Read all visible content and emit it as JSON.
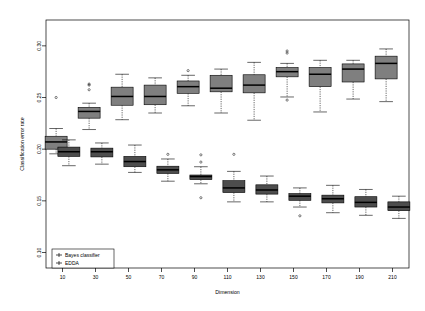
{
  "chart_data": {
    "type": "box",
    "title": "",
    "xlabel": "Dimension",
    "ylabel": "Classification error rate",
    "xtick_labels": [
      "10",
      "30",
      "50",
      "70",
      "90",
      "110",
      "130",
      "150",
      "170",
      "190",
      "210"
    ],
    "ytick_labels": [
      "0.10",
      "0.15",
      "0.20",
      "0.25",
      "0.30"
    ],
    "ytick_values": [
      0.1,
      0.15,
      0.2,
      0.25,
      0.3
    ],
    "ylim": [
      0.085,
      0.325
    ],
    "grid": false,
    "legend_position": "bottom-left",
    "legend": [
      {
        "label": "Bayes classifier",
        "color": "#4d4d4d"
      },
      {
        "label": "EDDA",
        "color": "#7f7f7f"
      }
    ],
    "categories": [
      10,
      30,
      50,
      70,
      90,
      110,
      130,
      150,
      170,
      190,
      210
    ],
    "series": [
      {
        "name": "EDDA",
        "color": "#7f7f7f",
        "boxes": [
          {
            "x": 10,
            "min": 0.1955,
            "q1": 0.2,
            "median": 0.207,
            "q3": 0.2125,
            "max": 0.22,
            "outliers": [
              0.25
            ]
          },
          {
            "x": 30,
            "min": 0.219,
            "q1": 0.23,
            "median": 0.2365,
            "q3": 0.2405,
            "max": 0.2445,
            "outliers": [
              0.2575,
              0.262,
              0.263
            ]
          },
          {
            "x": 50,
            "min": 0.2285,
            "q1": 0.2425,
            "median": 0.251,
            "q3": 0.26,
            "max": 0.2725,
            "outliers": []
          },
          {
            "x": 70,
            "min": 0.235,
            "q1": 0.243,
            "median": 0.251,
            "q3": 0.262,
            "max": 0.269,
            "outliers": []
          },
          {
            "x": 90,
            "min": 0.242,
            "q1": 0.254,
            "median": 0.2605,
            "q3": 0.266,
            "max": 0.2715,
            "outliers": [
              0.276
            ]
          },
          {
            "x": 110,
            "min": 0.235,
            "q1": 0.2555,
            "median": 0.259,
            "q3": 0.2715,
            "max": 0.2775,
            "outliers": []
          },
          {
            "x": 130,
            "min": 0.228,
            "q1": 0.2545,
            "median": 0.262,
            "q3": 0.272,
            "max": 0.284,
            "outliers": []
          },
          {
            "x": 150,
            "min": 0.2505,
            "q1": 0.27,
            "median": 0.275,
            "q3": 0.279,
            "max": 0.283,
            "outliers": [
              0.2475,
              0.293,
              0.295
            ]
          },
          {
            "x": 170,
            "min": 0.236,
            "q1": 0.2605,
            "median": 0.2725,
            "q3": 0.279,
            "max": 0.286,
            "outliers": []
          },
          {
            "x": 190,
            "min": 0.2485,
            "q1": 0.265,
            "median": 0.2775,
            "q3": 0.2825,
            "max": 0.286,
            "outliers": []
          },
          {
            "x": 210,
            "min": 0.246,
            "q1": 0.268,
            "median": 0.283,
            "q3": 0.29,
            "max": 0.297,
            "outliers": []
          }
        ]
      },
      {
        "name": "Bayes classifier",
        "color": "#4d4d4d",
        "boxes": [
          {
            "x": 10,
            "min": 0.184,
            "q1": 0.193,
            "median": 0.1975,
            "q3": 0.202,
            "max": 0.209,
            "outliers": []
          },
          {
            "x": 30,
            "min": 0.1855,
            "q1": 0.1925,
            "median": 0.1975,
            "q3": 0.201,
            "max": 0.206,
            "outliers": []
          },
          {
            "x": 50,
            "min": 0.1775,
            "q1": 0.183,
            "median": 0.188,
            "q3": 0.193,
            "max": 0.204,
            "outliers": []
          },
          {
            "x": 70,
            "min": 0.169,
            "q1": 0.1765,
            "median": 0.18,
            "q3": 0.1835,
            "max": 0.1905,
            "outliers": [
              0.195
            ]
          },
          {
            "x": 90,
            "min": 0.1665,
            "q1": 0.1705,
            "median": 0.1735,
            "q3": 0.175,
            "max": 0.183,
            "outliers": [
              0.153,
              0.1875,
              0.1945
            ]
          },
          {
            "x": 110,
            "min": 0.149,
            "q1": 0.158,
            "median": 0.1625,
            "q3": 0.1695,
            "max": 0.1785,
            "outliers": [
              0.195
            ]
          },
          {
            "x": 130,
            "min": 0.149,
            "q1": 0.1565,
            "median": 0.1605,
            "q3": 0.1655,
            "max": 0.174,
            "outliers": []
          },
          {
            "x": 150,
            "min": 0.144,
            "q1": 0.1505,
            "median": 0.1545,
            "q3": 0.157,
            "max": 0.1625,
            "outliers": [
              0.1355
            ]
          },
          {
            "x": 170,
            "min": 0.1385,
            "q1": 0.148,
            "median": 0.152,
            "q3": 0.1555,
            "max": 0.165,
            "outliers": []
          },
          {
            "x": 190,
            "min": 0.136,
            "q1": 0.144,
            "median": 0.1485,
            "q3": 0.154,
            "max": 0.161,
            "outliers": []
          },
          {
            "x": 210,
            "min": 0.133,
            "q1": 0.1405,
            "median": 0.144,
            "q3": 0.149,
            "max": 0.1545,
            "outliers": []
          }
        ]
      }
    ]
  }
}
